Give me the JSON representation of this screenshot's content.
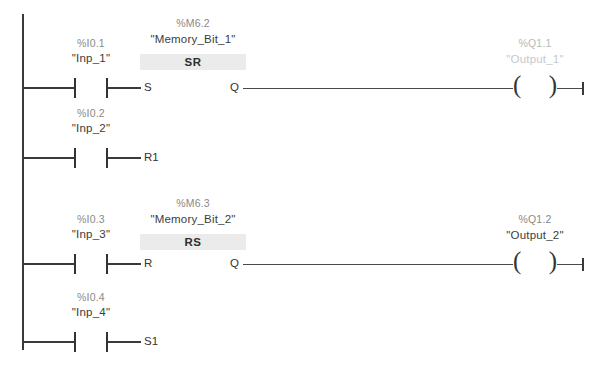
{
  "diagram": {
    "type": "ladder-logic",
    "networks": [
      {
        "id": "network-1",
        "block": {
          "address": "%M6.2",
          "name": "\"Memory_Bit_1\"",
          "type": "SR",
          "input_terminal": "S",
          "output_terminal": "Q",
          "second_input_terminal": "R1"
        },
        "contacts": [
          {
            "address": "%I0.1",
            "name": "\"Inp_1\"",
            "target": "S"
          },
          {
            "address": "%I0.2",
            "name": "\"Inp_2\"",
            "target": "R1"
          }
        ],
        "coil": {
          "address": "%Q1.1",
          "name": "\"Output_1\"",
          "faded": true
        }
      },
      {
        "id": "network-2",
        "block": {
          "address": "%M6.3",
          "name": "\"Memory_Bit_2\"",
          "type": "RS",
          "input_terminal": "R",
          "output_terminal": "Q",
          "second_input_terminal": "S1"
        },
        "contacts": [
          {
            "address": "%I0.3",
            "name": "\"Inp_3\"",
            "target": "R"
          },
          {
            "address": "%I0.4",
            "name": "\"Inp_4\"",
            "target": "S1"
          }
        ],
        "coil": {
          "address": "%Q1.2",
          "name": "\"Output_2\"",
          "faded": false
        }
      }
    ],
    "colors": {
      "wire": "#3a3a3a",
      "block_band": "#ebebeb",
      "address_text": "#8a8a8a",
      "name_text": "#3c3c3c",
      "faded_text": "#c8c8c8"
    }
  }
}
